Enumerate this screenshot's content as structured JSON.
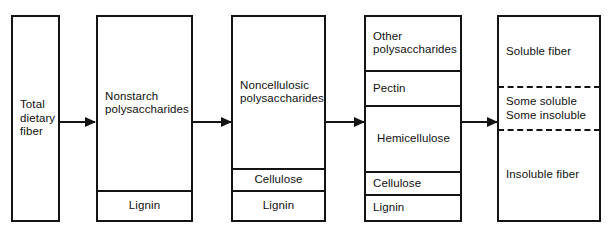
{
  "diagram": {
    "background_color": "#ffffff",
    "line_color": "#141414",
    "columns": [
      {
        "id": "col-1",
        "name": "total-dietary-fiber",
        "cells": [
          {
            "label": "Total\ndietary\nfiber",
            "align": "left",
            "divider": "none"
          }
        ]
      },
      {
        "id": "col-2",
        "name": "nonstarch-polysaccharides",
        "cells": [
          {
            "label": "Nonstarch\npolysaccharides",
            "align": "left",
            "divider": "none"
          },
          {
            "label": "Lignin",
            "align": "center",
            "divider": "solid"
          }
        ]
      },
      {
        "id": "col-3",
        "name": "noncellulosic-polysaccharides",
        "cells": [
          {
            "label": "Noncellulosic\npolysaccharides",
            "align": "left",
            "divider": "none"
          },
          {
            "label": "Cellulose",
            "align": "center",
            "divider": "solid"
          },
          {
            "label": "Lignin",
            "align": "center",
            "divider": "solid"
          }
        ]
      },
      {
        "id": "col-4",
        "name": "fiber-components",
        "cells": [
          {
            "label": "Other\npolysaccharides",
            "align": "left",
            "divider": "none"
          },
          {
            "label": "Pectin",
            "align": "left",
            "divider": "solid"
          },
          {
            "label": "Hemicellulose",
            "align": "left",
            "divider": "solid"
          },
          {
            "label": "Cellulose",
            "align": "left",
            "divider": "solid"
          },
          {
            "label": "Lignin",
            "align": "left",
            "divider": "solid"
          }
        ]
      },
      {
        "id": "col-5",
        "name": "solubility-classification",
        "cells": [
          {
            "label": "Soluble fiber",
            "align": "left",
            "divider": "none"
          },
          {
            "label": "Some soluble\nSome insoluble",
            "align": "left",
            "divider": "dashed"
          },
          {
            "label": "Insoluble fiber",
            "align": "left",
            "divider": "dashed"
          }
        ]
      }
    ],
    "arrows": [
      {
        "name": "arrow-1",
        "from": "total-dietary-fiber",
        "to": "nonstarch-polysaccharides"
      },
      {
        "name": "arrow-2",
        "from": "nonstarch-polysaccharides",
        "to": "noncellulosic-polysaccharides"
      },
      {
        "name": "arrow-3",
        "from": "noncellulosic-polysaccharides",
        "to": "fiber-components"
      },
      {
        "name": "arrow-4",
        "from": "fiber-components",
        "to": "solubility-classification"
      }
    ]
  }
}
